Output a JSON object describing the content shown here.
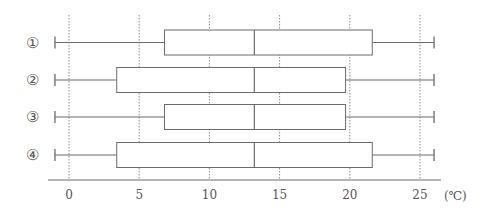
{
  "chart_data": {
    "type": "boxplot",
    "title": "",
    "xlabel": "",
    "unit": "(℃)",
    "xlim": [
      -1.5,
      26.5
    ],
    "x_ticks": [
      0,
      5,
      10,
      15,
      20,
      25
    ],
    "x_tick_labels": [
      "0",
      "5",
      "10",
      "15",
      "20",
      "25"
    ],
    "grid": {
      "vertical": true,
      "style": "dotted"
    },
    "orientation": "horizontal",
    "categories": [
      "①",
      "②",
      "③",
      "④"
    ],
    "series": [
      {
        "name": "①",
        "min": -1.0,
        "q1": 6.8,
        "median": 13.2,
        "q3": 21.6,
        "max": 26.0
      },
      {
        "name": "②",
        "min": -1.0,
        "q1": 3.4,
        "median": 13.2,
        "q3": 19.7,
        "max": 26.0
      },
      {
        "name": "③",
        "min": -1.0,
        "q1": 6.8,
        "median": 13.2,
        "q3": 19.7,
        "max": 26.0
      },
      {
        "name": "④",
        "min": -1.0,
        "q1": 3.4,
        "median": 13.2,
        "q3": 21.6,
        "max": 26.0
      }
    ]
  },
  "colors": {
    "line": "#6b6b6b",
    "grid": "#8a8a8a",
    "text": "#555555",
    "background": "#ffffff"
  },
  "layout": {
    "x0_px": 69,
    "px_per_unit": 14.04,
    "row_centers_px": [
      42.5,
      80,
      117,
      155
    ],
    "box_height_px": 25,
    "cap_height_px": 12,
    "axis_y_px": 180,
    "axis_x_start_px": 48,
    "axis_x_end_px": 441,
    "grid_top_px": 15,
    "row_label_x_px": 32,
    "tick_label_y_px": 199,
    "unit_label_x_px": 444
  }
}
